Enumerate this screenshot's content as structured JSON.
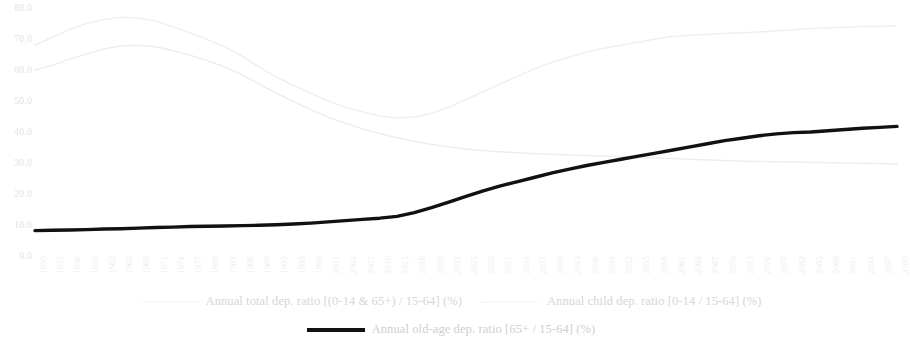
{
  "chart_data": {
    "type": "line",
    "title": "",
    "xlabel": "",
    "ylabel": "",
    "ylim": [
      0,
      80
    ],
    "ytick_step": 10,
    "grid": false,
    "legend_position": "bottom",
    "x_start": 1950,
    "x_end": 2100,
    "x_tick_step": 3,
    "yticks": [
      "80.0",
      "70.0",
      "60.0",
      "50.0",
      "40.0",
      "30.0",
      "20.0",
      "10.0",
      "0.0"
    ],
    "categories": [
      "1950",
      "1953",
      "1956",
      "1959",
      "1962",
      "1965",
      "1968",
      "1971",
      "1974",
      "1977",
      "1980",
      "1983",
      "1986",
      "1989",
      "1992",
      "1995",
      "1998",
      "2001",
      "2004",
      "2007",
      "2010",
      "2013",
      "2016",
      "2019",
      "2022",
      "2025",
      "2028",
      "2031",
      "2034",
      "2037",
      "2040",
      "2043",
      "2046",
      "2049",
      "2052",
      "2055",
      "2058",
      "2061",
      "2064",
      "2067",
      "2070",
      "2073",
      "2076",
      "2079",
      "2082",
      "2085",
      "2088",
      "2091",
      "2094",
      "2097",
      "2100"
    ],
    "series": [
      {
        "name": "Annual total dep. ratio [(0-14 & 65+) / 15-64] (%)",
        "style": "dotted",
        "color": "#ededed",
        "values": [
          68.0,
          70.5,
          73.0,
          75.0,
          76.3,
          77.0,
          76.8,
          75.8,
          74.0,
          72.0,
          69.8,
          67.5,
          64.5,
          61.0,
          57.8,
          55.0,
          52.5,
          50.0,
          48.0,
          46.5,
          45.2,
          44.5,
          44.8,
          46.0,
          48.0,
          50.5,
          53.0,
          55.5,
          58.0,
          60.5,
          62.5,
          64.2,
          65.8,
          67.0,
          68.0,
          69.0,
          70.0,
          70.8,
          71.2,
          71.5,
          71.8,
          72.0,
          72.3,
          72.6,
          73.0,
          73.4,
          73.6,
          73.8,
          74.0,
          74.1,
          74.2
        ]
      },
      {
        "name": "Annual child dep. ratio [0-14 / 15-64] (%)",
        "style": "dotted",
        "color": "#ebebeb",
        "values": [
          60.0,
          61.5,
          63.5,
          65.2,
          66.8,
          67.8,
          68.0,
          67.5,
          66.3,
          64.8,
          63.0,
          61.0,
          58.5,
          55.5,
          52.5,
          49.8,
          47.2,
          44.8,
          42.8,
          41.0,
          39.5,
          38.2,
          37.0,
          36.0,
          35.2,
          34.5,
          34.0,
          33.6,
          33.3,
          33.0,
          32.8,
          32.6,
          32.4,
          32.2,
          32.0,
          31.8,
          31.6,
          31.4,
          31.2,
          31.0,
          30.8,
          30.6,
          30.5,
          30.4,
          30.3,
          30.2,
          30.1,
          30.0,
          29.9,
          29.8,
          29.7
        ]
      },
      {
        "name": "Annual old-age dep. ratio [65+ / 15-64] (%)",
        "style": "solid",
        "color": "#111111",
        "values": [
          8.2,
          8.3,
          8.4,
          8.5,
          8.7,
          8.8,
          9.0,
          9.2,
          9.3,
          9.5,
          9.6,
          9.7,
          9.8,
          9.9,
          10.1,
          10.3,
          10.6,
          11.0,
          11.4,
          11.8,
          12.2,
          12.8,
          14.0,
          15.6,
          17.4,
          19.2,
          21.0,
          22.6,
          24.0,
          25.4,
          26.8,
          28.0,
          29.2,
          30.2,
          31.2,
          32.2,
          33.2,
          34.2,
          35.2,
          36.2,
          37.2,
          38.0,
          38.8,
          39.4,
          39.8,
          40.0,
          40.4,
          40.8,
          41.2,
          41.5,
          41.8
        ]
      }
    ]
  },
  "legend": {
    "items": [
      {
        "label": "Annual total dep. ratio [(0-14 & 65+) / 15-64] (%)",
        "marker": "dotted-line-swatch"
      },
      {
        "label": "Annual child dep. ratio [0-14 / 15-64] (%)",
        "marker": "dotted-line-swatch"
      },
      {
        "label": "Annual old-age dep. ratio [65+ / 15-64] (%)",
        "marker": "solid-line-swatch"
      }
    ]
  }
}
